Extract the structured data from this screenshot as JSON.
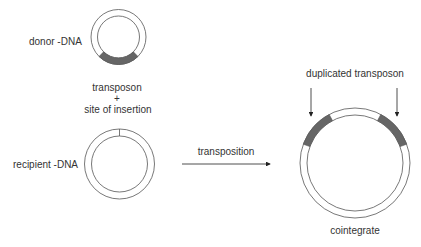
{
  "diagram": {
    "donor": {
      "label": "donor -DNA",
      "transposon_label": "transposon",
      "plus": "+",
      "site_label": "site of insertion"
    },
    "recipient": {
      "label": "recipient -DNA"
    },
    "process": {
      "arrow_label": "transposition"
    },
    "product": {
      "annotation": "duplicated transposon",
      "label": "cointegrate"
    },
    "colors": {
      "stroke": "#555555",
      "transposon_fill": "#666666",
      "text": "#333333"
    }
  }
}
